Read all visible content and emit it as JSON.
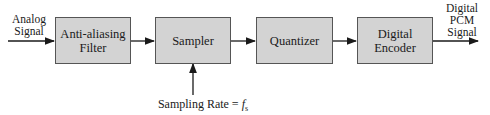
{
  "diagram": {
    "input_label": [
      "Analog",
      "Signal"
    ],
    "output_label": [
      "Digital",
      "PCM",
      "Signal"
    ],
    "blocks": [
      {
        "id": "anti-aliasing-filter",
        "lines": [
          "Anti-aliasing",
          "Filter"
        ]
      },
      {
        "id": "sampler",
        "lines": [
          "Sampler"
        ]
      },
      {
        "id": "quantizer",
        "lines": [
          "Quantizer"
        ]
      },
      {
        "id": "digital-encoder",
        "lines": [
          "Digital",
          "Encoder"
        ]
      }
    ],
    "sampling_label": "Sampling Rate = ",
    "sampling_symbol": "f",
    "sampling_subscript": "s",
    "colors": {
      "block_fill": "#d3d3d3",
      "line": "#1a1a1a"
    }
  }
}
